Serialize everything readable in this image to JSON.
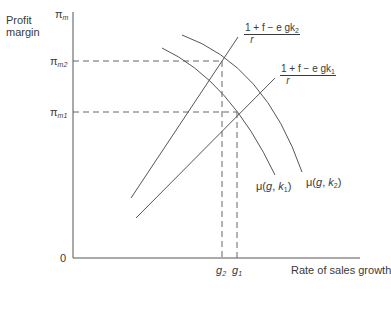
{
  "diagram": {
    "y_axis": {
      "label_line1": "Profit",
      "label_line2": "margin",
      "top_symbol": "π",
      "top_sub": "m",
      "ticks": [
        {
          "symbol": "π",
          "sub": "m2",
          "y": 61
        },
        {
          "symbol": "π",
          "sub": "m1",
          "y": 112
        }
      ],
      "origin": "0"
    },
    "x_axis": {
      "label": "Rate of sales growth",
      "ticks": [
        {
          "symbol": "g",
          "sub": "2",
          "x": 222
        },
        {
          "symbol": "g",
          "sub": "1",
          "x": 237
        }
      ]
    },
    "lines": [
      {
        "name": "line-k2",
        "label_num": "1 + f − e gk",
        "label_sub": "2",
        "label_den": "r",
        "from": [
          131,
          198
        ],
        "to": [
          238,
          37
        ]
      },
      {
        "name": "line-k1",
        "label_num": "1 + f − e gk",
        "label_sub": "1",
        "label_den": "r",
        "from": [
          136,
          218
        ],
        "to": [
          275,
          78
        ]
      }
    ],
    "curves": [
      {
        "name": "mu-k1",
        "label_prefix": "μ(",
        "label_var": "g",
        "label_mid": ", ",
        "label_k": "k",
        "label_sub": "1",
        "label_suffix": ")"
      },
      {
        "name": "mu-k2",
        "label_prefix": "μ(",
        "label_var": "g",
        "label_mid": ", ",
        "label_k": "k",
        "label_sub": "2",
        "label_suffix": ")"
      }
    ],
    "colors": {
      "ink": "#3a3a3a",
      "axis": "#555555",
      "background": "#ffffff"
    }
  }
}
